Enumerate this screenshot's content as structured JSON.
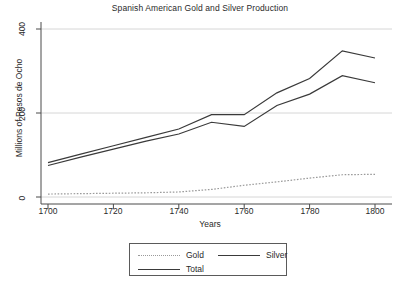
{
  "chart_data": {
    "type": "line",
    "title": "Spanish American Gold and Silver Production",
    "xlabel": "Years",
    "ylabel": "Millions of Pesos de Ocho",
    "x": [
      1700,
      1710,
      1720,
      1730,
      1740,
      1750,
      1760,
      1770,
      1780,
      1790,
      1800
    ],
    "xlim": [
      1700,
      1800
    ],
    "ylim": [
      0,
      400
    ],
    "xticks": [
      1700,
      1720,
      1740,
      1760,
      1780,
      1800
    ],
    "xtick_labels": [
      "1700",
      "1720",
      "1740",
      "1760",
      "1780",
      "1800"
    ],
    "yticks": [
      0,
      200,
      400
    ],
    "ytick_labels": [
      "0",
      "200",
      "400"
    ],
    "grid": "horizontal",
    "legend_position": "below-axes",
    "series": [
      {
        "name": "Gold",
        "style": "dotted",
        "color": "#9a9a9a",
        "values": [
          7,
          8,
          9,
          10,
          12,
          18,
          28,
          36,
          45,
          53,
          54
        ]
      },
      {
        "name": "Silver",
        "style": "solid",
        "color": "#3a3a3a",
        "values": [
          75,
          95,
          114,
          133,
          150,
          178,
          168,
          218,
          245,
          289,
          272
        ]
      },
      {
        "name": "Total",
        "style": "solid",
        "color": "#3a3a3a",
        "values": [
          82,
          102,
          122,
          142,
          162,
          196,
          196,
          248,
          282,
          348,
          331
        ]
      }
    ]
  },
  "legend": {
    "gold_label": "Gold",
    "silver_label": "Silver",
    "total_label": "Total"
  }
}
